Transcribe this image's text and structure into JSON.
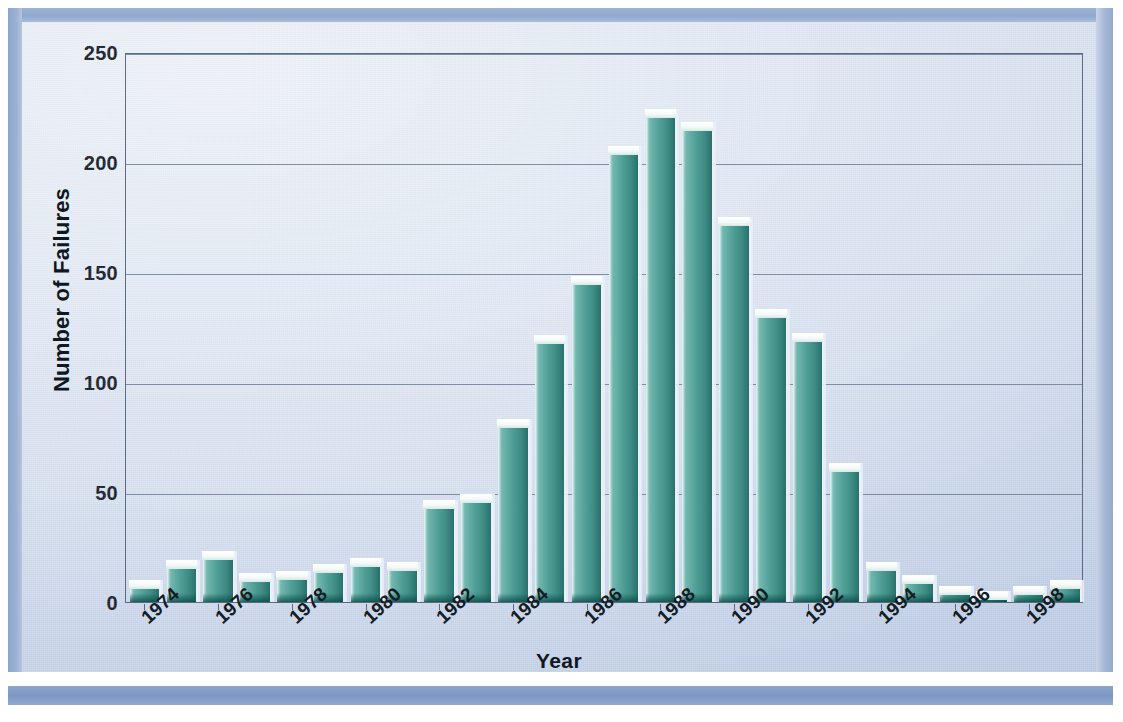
{
  "figure": {
    "background_color": "#dde5f2",
    "frame_color": "#8da5cc",
    "bar_color": "#4f9e96",
    "axis_color": "#5a6b86",
    "grid_color": "#6d7d96"
  },
  "chart_data": {
    "type": "bar",
    "title": "",
    "xlabel": "Year",
    "ylabel": "Number of Failures",
    "ylim": [
      0,
      250
    ],
    "yticks": [
      0,
      50,
      100,
      150,
      200,
      250
    ],
    "grid": true,
    "legend": null,
    "xtick_rotation": -42,
    "xtick_labels": [
      "1974",
      "1976",
      "1978",
      "1980",
      "1982",
      "1984",
      "1986",
      "1988",
      "1990",
      "1992",
      "1994",
      "1996",
      "1998"
    ],
    "categories": [
      "1974",
      "1975",
      "1976",
      "1977",
      "1978",
      "1979",
      "1980",
      "1981",
      "1982",
      "1983",
      "1984",
      "1985",
      "1986",
      "1987",
      "1988",
      "1989",
      "1990",
      "1991",
      "1992",
      "1993",
      "1994",
      "1995",
      "1996",
      "1997",
      "1998",
      "1999"
    ],
    "values": [
      7,
      16,
      20,
      10,
      11,
      14,
      17,
      15,
      43,
      46,
      80,
      118,
      145,
      204,
      221,
      215,
      172,
      130,
      119,
      60,
      15,
      9,
      4,
      2,
      4,
      7
    ]
  }
}
